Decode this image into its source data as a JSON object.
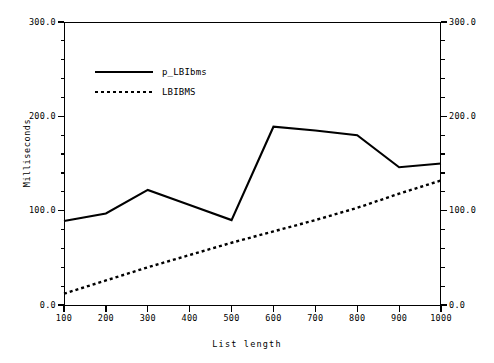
{
  "chart_data": {
    "type": "line",
    "title": "",
    "xlabel": "List length",
    "ylabel": "Milliseconds",
    "xlim": [
      100,
      1000
    ],
    "ylim": [
      0.0,
      300.0
    ],
    "grid": false,
    "legend_position": "upper-left-inside",
    "x": [
      100,
      200,
      300,
      400,
      500,
      600,
      700,
      800,
      900,
      1000
    ],
    "x_tick_labels": [
      "100",
      "200",
      "300",
      "400",
      "500",
      "600",
      "700",
      "800",
      "900",
      "1000"
    ],
    "y_tick_labels": [
      "0.0",
      "100.0",
      "200.0",
      "300.0"
    ],
    "y_ticks": [
      0.0,
      100.0,
      200.0,
      300.0
    ],
    "right_axis_tick_labels": [
      "0.0",
      "100.0",
      "200.0",
      "300.0"
    ],
    "series": [
      {
        "name": "p_LBIbms",
        "style": "solid",
        "color": "#000000",
        "values": [
          89,
          97,
          122,
          106,
          90,
          189,
          185,
          180,
          146,
          150
        ]
      },
      {
        "name": "LBIBMS",
        "style": "dotted",
        "color": "#000000",
        "values": [
          12,
          26,
          40,
          53,
          66,
          78,
          90,
          103,
          118,
          132
        ]
      }
    ]
  },
  "legend": {
    "items": [
      {
        "label": "p_LBIbms",
        "style": "solid"
      },
      {
        "label": "LBIBMS",
        "style": "dotted"
      }
    ]
  },
  "axes": {
    "y_left_title": "Milliseconds",
    "x_title": "List length"
  }
}
